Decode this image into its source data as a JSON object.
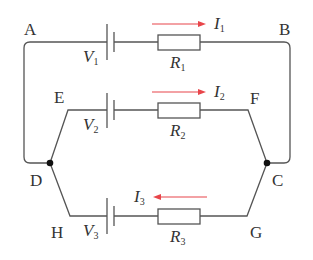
{
  "diagram": {
    "type": "circuit",
    "nodes": {
      "A": "A",
      "B": "B",
      "C": "C",
      "D": "D",
      "E": "E",
      "F": "F",
      "G": "G",
      "H": "H"
    },
    "branches": [
      {
        "battery": {
          "symbol": "V",
          "sub": "1"
        },
        "resistor": {
          "symbol": "R",
          "sub": "1"
        },
        "current": {
          "symbol": "I",
          "sub": "1",
          "direction": "right"
        }
      },
      {
        "battery": {
          "symbol": "V",
          "sub": "2"
        },
        "resistor": {
          "symbol": "R",
          "sub": "2"
        },
        "current": {
          "symbol": "I",
          "sub": "2",
          "direction": "right"
        }
      },
      {
        "battery": {
          "symbol": "V",
          "sub": "3"
        },
        "resistor": {
          "symbol": "R",
          "sub": "3"
        },
        "current": {
          "symbol": "I",
          "sub": "3",
          "direction": "left"
        }
      }
    ],
    "colors": {
      "wire": "#555555",
      "arrow": "#e8454a",
      "node": "#111111"
    }
  }
}
